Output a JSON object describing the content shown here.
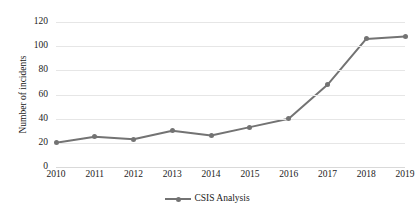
{
  "chart_data": {
    "type": "line",
    "title": "",
    "subtitle": "",
    "xlabel": "",
    "ylabel": "Number of incidents",
    "categories": [
      "2010",
      "2011",
      "2012",
      "2013",
      "2014",
      "2015",
      "2016",
      "2017",
      "2018",
      "2019"
    ],
    "x": [
      2010,
      2011,
      2012,
      2013,
      2014,
      2015,
      2016,
      2017,
      2018,
      2019
    ],
    "series": [
      {
        "name": "CSIS Analysis",
        "values": [
          20,
          25,
          23,
          30,
          26,
          33,
          40,
          68,
          106,
          108
        ],
        "color": "#737373",
        "marker": "circle"
      }
    ],
    "ylim": [
      0,
      120
    ],
    "yticks": [
      0,
      20,
      40,
      60,
      80,
      100,
      120
    ],
    "ytick_labels": [
      "0",
      "20",
      "40",
      "60",
      "80",
      "100",
      "120"
    ],
    "xtick_labels": [
      "2010",
      "2011",
      "2012",
      "2013",
      "2014",
      "2015",
      "2016",
      "2017",
      "2018",
      "2019"
    ],
    "grid": true,
    "grid_axis": "y",
    "grid_color": "#e6e6e6",
    "legend": [
      "CSIS Analysis"
    ],
    "legend_position": "bottom",
    "background": "#ffffff"
  },
  "legend": {
    "entries": [
      {
        "label": "CSIS Analysis",
        "marker_icon": "line-marker-icon"
      }
    ]
  },
  "axes": {
    "y_title": "Number of incidents"
  }
}
